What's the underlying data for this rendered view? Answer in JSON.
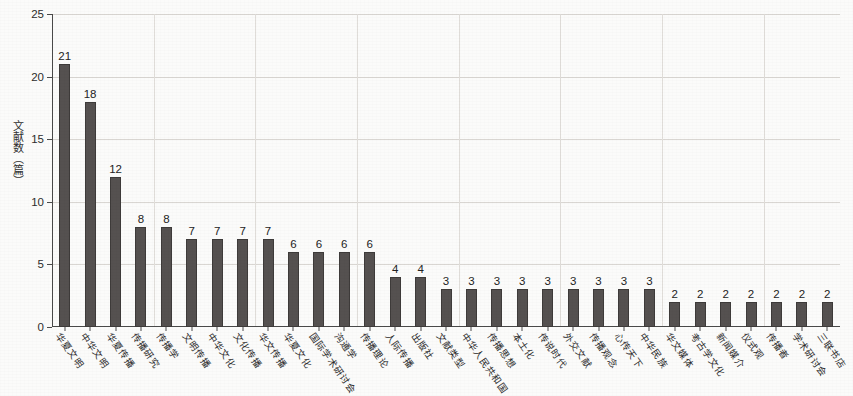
{
  "chart_data": {
    "type": "bar",
    "title": "",
    "subtitle": "",
    "xlabel": "",
    "ylabel": "文献数（篇）",
    "ylim": [
      0,
      25
    ],
    "y_ticks": [
      0,
      5,
      10,
      15,
      20,
      25
    ],
    "grid": true,
    "legend": null,
    "bar_color": "#555150",
    "show_value_labels": true,
    "categories": [
      "华夏文明",
      "中华文明",
      "华夏传播",
      "传播研究",
      "传播学",
      "文明传播",
      "中华文化",
      "文化传播",
      "华文传播",
      "华夏文化",
      "国际学术研讨会",
      "沟通学",
      "传播理论",
      "人际传播",
      "出版社",
      "文献类型",
      "中华人民共和国",
      "传播思想",
      "本土化",
      "传说时代",
      "外交文献",
      "传播观念",
      "心传天下",
      "中华民族",
      "华文媒体",
      "考古学文化",
      "新闻媒介",
      "仪式观",
      "传播者",
      "学术研讨会",
      "三联书店"
    ],
    "values": [
      21,
      18,
      12,
      8,
      8,
      7,
      7,
      7,
      7,
      6,
      6,
      6,
      6,
      4,
      4,
      3,
      3,
      3,
      3,
      3,
      3,
      3,
      3,
      3,
      2,
      2,
      2,
      2,
      2,
      2,
      2
    ]
  }
}
